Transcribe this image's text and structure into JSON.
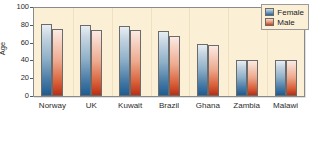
{
  "chart_data": {
    "type": "bar",
    "title": "",
    "xlabel": "",
    "ylabel": "Age",
    "ylim": [
      0,
      100
    ],
    "yticks": [
      "0",
      "20",
      "40",
      "60",
      "80",
      "100"
    ],
    "grid": false,
    "legend_position": "top-right",
    "categories": [
      "Norway",
      "UK",
      "Kuwait",
      "Brazil",
      "Ghana",
      "Zambia",
      "Malawi"
    ],
    "series": [
      {
        "name": "Female",
        "color": "#2a659b",
        "values": [
          81,
          80,
          79,
          73,
          59,
          41,
          41
        ]
      },
      {
        "name": "Male",
        "color": "#c6401d",
        "values": [
          75,
          74,
          74,
          67,
          57,
          40,
          40
        ]
      }
    ]
  },
  "legend": {
    "items": [
      {
        "label": "Female"
      },
      {
        "label": "Male"
      }
    ]
  }
}
